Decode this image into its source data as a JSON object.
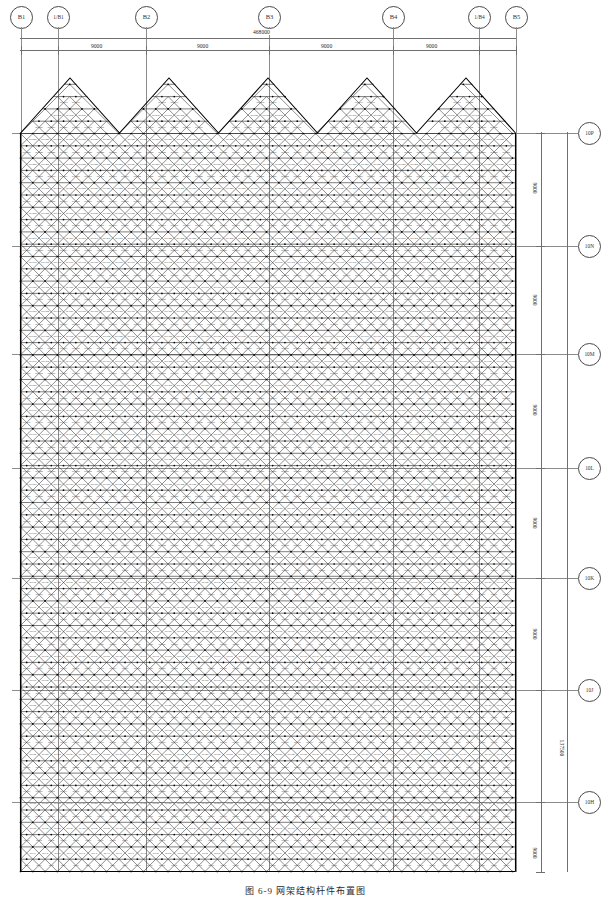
{
  "drawing": {
    "type": "space-frame-roof-plan",
    "caption": "图 6-9  网架结构杆件布置图",
    "units": "mm"
  },
  "horizontal_grid": {
    "labels": [
      "B1",
      "1/B1",
      "B2",
      "B3",
      "B4",
      "1/B4",
      "B5"
    ],
    "overall_dim": "468000",
    "bay_dims": [
      "9000",
      "9000",
      "9000",
      "9000"
    ],
    "bay_label_positions": [
      101,
      224,
      330,
      453
    ]
  },
  "vertical_grid": {
    "labels": [
      "10P",
      "10N",
      "10M",
      "10L",
      "10K",
      "10J",
      "10H"
    ],
    "overall_dim": "137500",
    "bay_dims": [
      "9000",
      "9000",
      "9000",
      "9000",
      "9000",
      "9000"
    ]
  },
  "structure": {
    "name": "diagrid-space-frame",
    "top_edge": "sawtooth",
    "module": "12.3",
    "peak_count": 5,
    "member_tag_sample": "WJ-1",
    "line_color": "#1c1c1c"
  },
  "colors": {
    "grid_line": "#8c8c8c",
    "dim_line": "#6f6f6f",
    "member": "#1c1c1c",
    "bubble_border": "#4a4a4a",
    "background": "#ffffff"
  }
}
